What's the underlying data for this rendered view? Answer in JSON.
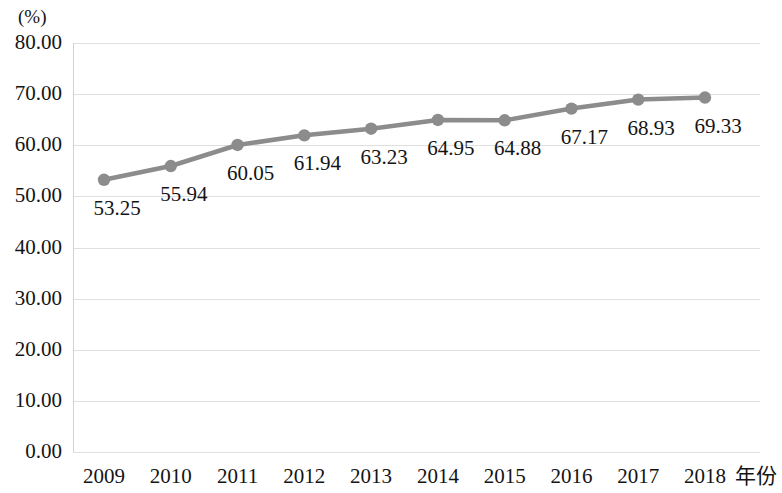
{
  "chart_data": {
    "type": "line",
    "title": "",
    "xlabel": "年份",
    "ylabel": "(%)",
    "categories": [
      "2009",
      "2010",
      "2011",
      "2012",
      "2013",
      "2014",
      "2015",
      "2016",
      "2017",
      "2018"
    ],
    "values": [
      53.25,
      55.94,
      60.05,
      61.94,
      63.23,
      64.95,
      64.88,
      67.17,
      68.93,
      69.33
    ],
    "point_labels": [
      "53.25",
      "55.94",
      "60.05",
      "61.94",
      "63.23",
      "64.95",
      "64.88",
      "67.17",
      "68.93",
      "69.33"
    ],
    "ylim": [
      0,
      80
    ],
    "ytick_labels": [
      "80.00",
      "70.00",
      "60.00",
      "50.00",
      "40.00",
      "30.00",
      "20.00",
      "10.00",
      "0.00"
    ],
    "ytick_values": [
      80,
      70,
      60,
      50,
      40,
      30,
      20,
      10,
      0
    ],
    "grid": true,
    "legend": "none",
    "series_color": "#8c8c8c",
    "grid_color": "#dcdcdc",
    "marker": "circle",
    "data_label_position": "below-right"
  }
}
